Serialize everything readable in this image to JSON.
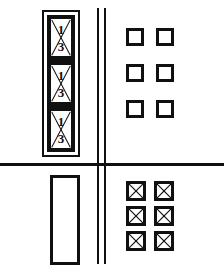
{
  "diagram": {
    "background_color": "#ffffff",
    "line_color": "#101010",
    "dividers": {
      "horizontal_label": "horizontal-divider",
      "vertical_label": "vertical-double-line"
    },
    "quadrants": {
      "top_left": {
        "name": "fraction-stack",
        "outer_frame_label": "outer-frame",
        "cells": [
          {
            "numerator": "1",
            "denominator": "3",
            "marking": "crossed"
          },
          {
            "numerator": "1",
            "denominator": "3",
            "marking": "crossed"
          },
          {
            "numerator": "1",
            "denominator": "3",
            "marking": "crossed"
          }
        ]
      },
      "bottom_left": {
        "name": "empty-tall-rectangle",
        "label": ""
      },
      "top_right": {
        "name": "empty-square-grid",
        "rows": 3,
        "columns": 2,
        "count": 6,
        "fill": "empty"
      },
      "bottom_right": {
        "name": "crossed-square-grid",
        "rows": 3,
        "columns": 2,
        "count": 6,
        "fill": "crossed"
      }
    }
  }
}
